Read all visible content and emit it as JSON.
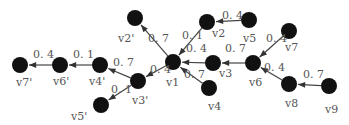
{
  "diagram": {
    "type": "directed-weighted-graph",
    "colors": {
      "node": "#111111",
      "edge": "#444444",
      "text": "#555555",
      "background": "#ffffff"
    },
    "nodes": [
      {
        "id": "v2p",
        "label": "v2'",
        "x": 135,
        "y": 18,
        "lx": 118,
        "ly": 42
      },
      {
        "id": "v2",
        "label": "v2",
        "x": 207,
        "y": 22,
        "lx": 212,
        "ly": 37
      },
      {
        "id": "v5",
        "label": "v5",
        "x": 249,
        "y": 20,
        "lx": 243,
        "ly": 42
      },
      {
        "id": "v7",
        "label": "v7",
        "x": 289,
        "y": 31,
        "lx": 285,
        "ly": 51
      },
      {
        "id": "v7p",
        "label": "v7'",
        "x": 20,
        "y": 65,
        "lx": 16,
        "ly": 86
      },
      {
        "id": "v6p",
        "label": "v6'",
        "x": 60,
        "y": 65,
        "lx": 53,
        "ly": 85
      },
      {
        "id": "v4p",
        "label": "v4'",
        "x": 100,
        "y": 65,
        "lx": 89,
        "ly": 85
      },
      {
        "id": "v1",
        "label": "v1",
        "x": 173,
        "y": 62,
        "lx": 166,
        "ly": 86
      },
      {
        "id": "v3",
        "label": "v3",
        "x": 213,
        "y": 63,
        "lx": 219,
        "ly": 77
      },
      {
        "id": "v6",
        "label": "v6",
        "x": 253,
        "y": 63,
        "lx": 249,
        "ly": 86
      },
      {
        "id": "v3p",
        "label": "v3'",
        "x": 138,
        "y": 81,
        "lx": 132,
        "ly": 104
      },
      {
        "id": "v4",
        "label": "v4",
        "x": 209,
        "y": 88,
        "lx": 208,
        "ly": 110
      },
      {
        "id": "v8",
        "label": "v8",
        "x": 289,
        "y": 84,
        "lx": 285,
        "ly": 107
      },
      {
        "id": "v9",
        "label": "v9",
        "x": 329,
        "y": 86,
        "lx": 325,
        "ly": 113
      },
      {
        "id": "v5p",
        "label": "v5'",
        "x": 101,
        "y": 105,
        "lx": 71,
        "ly": 120
      }
    ],
    "edges": [
      {
        "from": "v1",
        "to": "v2p",
        "weight": "0.7",
        "lx": 148,
        "ly": 42
      },
      {
        "from": "v2",
        "to": "v1",
        "weight": "0.1",
        "lx": 182,
        "ly": 39
      },
      {
        "from": "v5",
        "to": "v2",
        "weight": "0.4",
        "lx": 222,
        "ly": 19
      },
      {
        "from": "v3",
        "to": "v1",
        "weight": "0.4",
        "lx": 186,
        "ly": 52
      },
      {
        "from": "v6",
        "to": "v3",
        "weight": "0.7",
        "lx": 225,
        "ly": 52
      },
      {
        "from": "v7",
        "to": "v6",
        "weight": "0.4",
        "lx": 266,
        "ly": 42
      },
      {
        "from": "v8",
        "to": "v6",
        "weight": "0.4",
        "lx": 264,
        "ly": 71
      },
      {
        "from": "v9",
        "to": "v8",
        "weight": "0.7",
        "lx": 303,
        "ly": 78
      },
      {
        "from": "v4",
        "to": "v1",
        "weight": "0.7",
        "lx": 184,
        "ly": 78
      },
      {
        "from": "v1",
        "to": "v3p",
        "weight": "0.4",
        "lx": 150,
        "ly": 73
      },
      {
        "from": "v3p",
        "to": "v4p",
        "weight": "0.7",
        "lx": 113,
        "ly": 66
      },
      {
        "from": "v3p",
        "to": "v5p",
        "weight": "0.1",
        "lx": 111,
        "ly": 93
      },
      {
        "from": "v4p",
        "to": "v6p",
        "weight": "0.1",
        "lx": 73,
        "ly": 58
      },
      {
        "from": "v6p",
        "to": "v7p",
        "weight": "0.4",
        "lx": 33,
        "ly": 58
      }
    ]
  }
}
